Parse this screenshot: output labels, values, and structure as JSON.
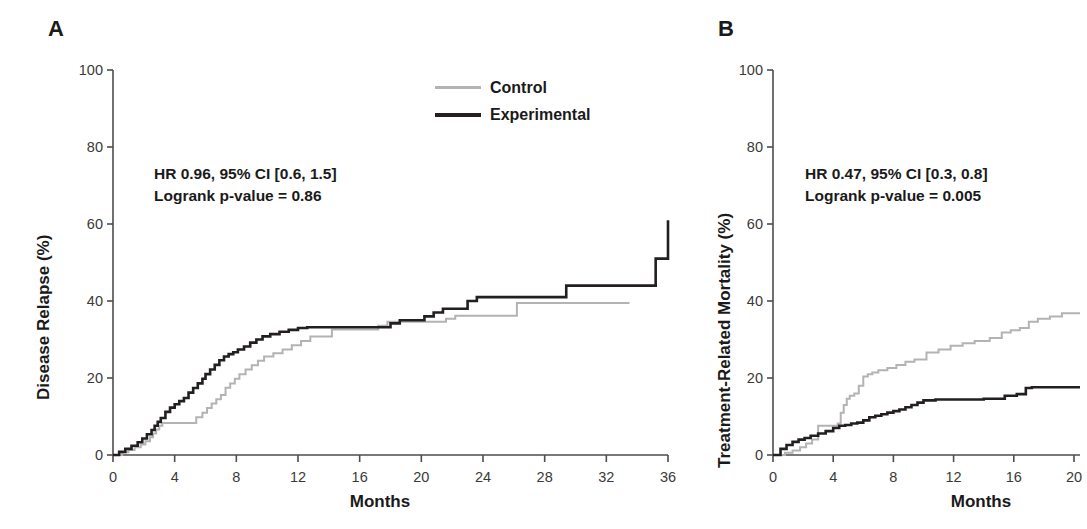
{
  "figure": {
    "panels": [
      {
        "letter": "A",
        "ylabel": "Disease Relapse (%)",
        "xlabel": "Months",
        "annotation_line1": "HR 0.96, 95% CI [0.6, 1.5]",
        "annotation_line2": "Logrank p-value = 0.86"
      },
      {
        "letter": "B",
        "ylabel": "Treatment-Related Mortality (%)",
        "xlabel": "Months",
        "annotation_line1": "HR 0.47, 95% CI [0.3, 0.8]",
        "annotation_line2": "Logrank p-value = 0.005"
      }
    ]
  },
  "legend": {
    "position": "top-right-panel-a",
    "entries": [
      {
        "label": "Control",
        "color": "#b3b3b3",
        "width": 3
      },
      {
        "label": "Experimental",
        "color": "#231f20",
        "width": 4
      }
    ]
  },
  "colors": {
    "control": "#b3b3b3",
    "experimental": "#231f20",
    "axis": "#4d4d4d",
    "text": "#1a1a1a"
  },
  "chart_data": [
    {
      "type": "line",
      "subtype": "kaplan-meier-cumulative-incidence",
      "panel": "A",
      "title": "Disease Relapse",
      "xlabel": "Months",
      "ylabel": "Disease Relapse (%)",
      "xlim": [
        0,
        36
      ],
      "ylim": [
        0,
        100
      ],
      "xticks": [
        0,
        4,
        8,
        12,
        16,
        20,
        24,
        28,
        32,
        36
      ],
      "yticks": [
        0,
        20,
        40,
        60,
        80,
        100
      ],
      "grid": false,
      "annotations": [
        "HR 0.96, 95% CI [0.6, 1.5]",
        "Logrank p-value = 0.86"
      ],
      "series": [
        {
          "name": "Control",
          "color": "#b3b3b3",
          "step": "post",
          "x": [
            0,
            0.6,
            1.0,
            1.4,
            1.8,
            2.1,
            2.4,
            2.6,
            2.8,
            3.0,
            3.2,
            5.0,
            5.4,
            5.8,
            6.1,
            6.4,
            6.7,
            7.0,
            7.3,
            7.6,
            7.9,
            8.2,
            8.6,
            9.0,
            9.4,
            9.8,
            10.4,
            11.0,
            11.6,
            12.2,
            12.8,
            14.2,
            16.6,
            17.2,
            17.8,
            20.8,
            21.6,
            22.2,
            22.8,
            25.6,
            26.2,
            33.5
          ],
          "y": [
            0,
            0.7,
            1.3,
            2.0,
            2.7,
            3.6,
            4.6,
            5.6,
            6.6,
            7.6,
            8.3,
            8.3,
            9.8,
            11.0,
            12.2,
            13.4,
            14.5,
            15.6,
            17.5,
            18.6,
            19.8,
            21.0,
            22.2,
            23.3,
            24.5,
            25.6,
            26.4,
            27.4,
            28.5,
            29.6,
            30.8,
            32.6,
            32.6,
            33.6,
            34.6,
            34.6,
            35.4,
            36.2,
            36.2,
            36.2,
            39.5,
            39.5
          ]
        },
        {
          "name": "Experimental",
          "color": "#231f20",
          "step": "post",
          "x": [
            0,
            0.4,
            0.8,
            1.2,
            1.6,
            1.9,
            2.2,
            2.5,
            2.7,
            2.9,
            3.1,
            3.4,
            3.7,
            4.0,
            4.3,
            4.6,
            4.9,
            5.2,
            5.5,
            5.8,
            6.0,
            6.3,
            6.6,
            6.9,
            7.2,
            7.5,
            7.8,
            8.1,
            8.5,
            8.9,
            9.3,
            9.7,
            10.2,
            10.8,
            11.4,
            12.0,
            12.6,
            13.2,
            17.4,
            18.0,
            18.6,
            19.2,
            20.2,
            20.8,
            21.4,
            22.2,
            23.0,
            23.6,
            29.4,
            34.6,
            35.2,
            36.0
          ],
          "y": [
            0,
            0.8,
            1.6,
            2.4,
            3.3,
            4.3,
            5.4,
            6.5,
            7.6,
            8.6,
            9.6,
            11.2,
            12.3,
            13.2,
            14.0,
            14.8,
            16.2,
            17.4,
            18.6,
            19.8,
            21.0,
            22.2,
            23.4,
            24.6,
            25.6,
            26.2,
            26.7,
            27.4,
            28.2,
            29.2,
            30.0,
            30.8,
            31.4,
            32.0,
            32.5,
            33.0,
            33.2,
            33.2,
            33.2,
            34.2,
            35.0,
            35.0,
            36.0,
            37.0,
            38.0,
            38.0,
            40.0,
            41.0,
            44.0,
            44.0,
            51.0,
            61.0
          ]
        }
      ]
    },
    {
      "type": "line",
      "subtype": "kaplan-meier-cumulative-incidence",
      "panel": "B",
      "title": "Treatment-Related Mortality",
      "xlabel": "Months",
      "ylabel": "Treatment-Related Mortality (%)",
      "xlim": [
        0,
        20.4
      ],
      "ylim": [
        0,
        100
      ],
      "xticks": [
        0,
        4,
        8,
        12,
        16,
        20
      ],
      "yticks": [
        0,
        20,
        40,
        60,
        80,
        100
      ],
      "grid": false,
      "cropped_right": true,
      "annotations": [
        "HR 0.47, 95% CI [0.3, 0.8]",
        "Logrank p-value = 0.005"
      ],
      "series": [
        {
          "name": "Control",
          "color": "#b3b3b3",
          "step": "post",
          "x": [
            0,
            0.8,
            1.3,
            1.8,
            2.2,
            2.6,
            3.0,
            3.4,
            4.3,
            4.5,
            4.7,
            4.9,
            5.1,
            5.4,
            5.7,
            6.0,
            6.3,
            6.6,
            7.0,
            7.6,
            8.2,
            8.8,
            9.4,
            10.2,
            11.0,
            11.8,
            12.6,
            13.4,
            14.4,
            15.2,
            15.8,
            16.4,
            17.0,
            17.6,
            18.4,
            19.2,
            20.4
          ],
          "y": [
            0,
            0.6,
            1.2,
            2.0,
            3.0,
            4.0,
            7.6,
            7.6,
            8.2,
            11.0,
            13.0,
            14.6,
            15.4,
            16.0,
            18.0,
            20.4,
            21.0,
            21.4,
            22.0,
            22.6,
            23.4,
            24.2,
            24.8,
            26.6,
            27.4,
            28.4,
            29.0,
            29.6,
            30.4,
            31.8,
            32.4,
            33.0,
            34.6,
            35.4,
            36.0,
            36.8,
            36.8
          ]
        },
        {
          "name": "Experimental",
          "color": "#231f20",
          "step": "post",
          "x": [
            0,
            0.5,
            0.9,
            1.3,
            1.7,
            2.1,
            2.5,
            3.0,
            3.5,
            4.0,
            4.4,
            4.8,
            5.2,
            5.6,
            6.0,
            6.4,
            6.8,
            7.2,
            7.6,
            8.0,
            8.4,
            8.8,
            9.2,
            9.6,
            10.0,
            10.8,
            11.6,
            12.4,
            13.2,
            14.0,
            14.8,
            15.4,
            16.2,
            16.8,
            17.2,
            17.6,
            20.4
          ],
          "y": [
            0,
            1.6,
            2.6,
            3.4,
            4.0,
            4.4,
            5.0,
            5.6,
            6.2,
            7.0,
            7.6,
            7.8,
            8.2,
            8.4,
            9.0,
            9.8,
            10.2,
            10.6,
            11.0,
            11.4,
            11.8,
            12.4,
            13.0,
            13.6,
            14.2,
            14.4,
            14.4,
            14.4,
            14.4,
            14.6,
            14.6,
            15.4,
            15.8,
            17.4,
            17.6,
            17.6,
            17.6
          ]
        }
      ]
    }
  ]
}
